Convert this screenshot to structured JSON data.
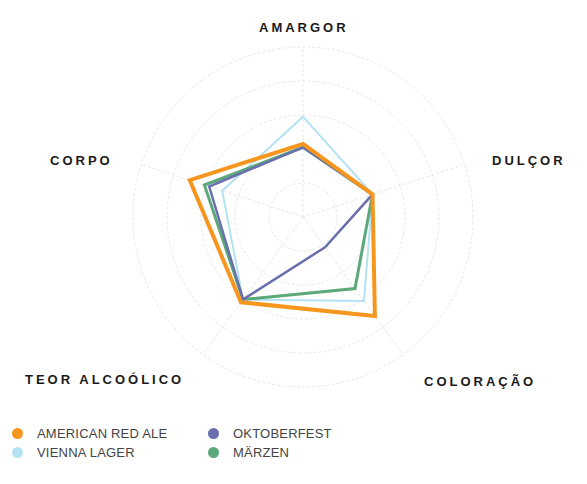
{
  "chart_data": {
    "type": "radar",
    "title": "",
    "axes": [
      "AMARGOR",
      "DULÇOR",
      "COLORAÇÃO",
      "TEOR ALCOÓLICO",
      "CORPO"
    ],
    "range": [
      0,
      1
    ],
    "rings": 5,
    "grid": true,
    "legend_position": "bottom-left",
    "series": [
      {
        "name": "AMERICAN RED ALE",
        "color": "#F7961E",
        "values": [
          0.43,
          0.43,
          0.72,
          0.62,
          0.7
        ]
      },
      {
        "name": "VIENNA LAGER",
        "color": "#B3E3F2",
        "values": [
          0.59,
          0.43,
          0.61,
          0.6,
          0.5
        ]
      },
      {
        "name": "OKTOBERFEST",
        "color": "#6A6FAE",
        "values": [
          0.41,
          0.43,
          0.22,
          0.6,
          0.58
        ]
      },
      {
        "name": "MÄRZEN",
        "color": "#5BA87A",
        "values": [
          0.41,
          0.43,
          0.52,
          0.6,
          0.61
        ]
      }
    ]
  },
  "labels": {
    "amargor": "AMARGOR",
    "dulcor": "DULÇOR",
    "coloracao": "COLORAÇÃO",
    "teor": "TEOR ALCOÓLICO",
    "corpo": "CORPO"
  },
  "legend": [
    {
      "label": "AMERICAN RED ALE",
      "color": "#F7961E"
    },
    {
      "label": "OKTOBERFEST",
      "color": "#6A6FAE"
    },
    {
      "label": "VIENNA LAGER",
      "color": "#B3E3F2"
    },
    {
      "label": "MÄRZEN",
      "color": "#5BA87A"
    }
  ]
}
